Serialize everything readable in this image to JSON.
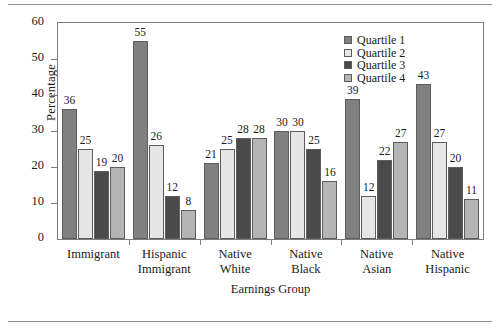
{
  "chart_data": {
    "type": "bar",
    "title": "",
    "xlabel": "Earnings Group",
    "ylabel": "Percentage",
    "ylim": [
      0,
      60
    ],
    "yticks": [
      0,
      10,
      20,
      30,
      40,
      50,
      60
    ],
    "grid": false,
    "legend_position": "top-right",
    "categories": [
      "Immigrant",
      "Hispanic Immigrant",
      "Native White",
      "Native Black",
      "Native Asian",
      "Native Hispanic"
    ],
    "category_lines": [
      [
        "Immigrant"
      ],
      [
        "Hispanic",
        "Immigrant"
      ],
      [
        "Native",
        "White"
      ],
      [
        "Native",
        "Black"
      ],
      [
        "Native",
        "Asian"
      ],
      [
        "Native",
        "Hispanic"
      ]
    ],
    "series": [
      {
        "name": "Quartile 1",
        "color": "#808080",
        "values": [
          36,
          55,
          21,
          30,
          39,
          43
        ]
      },
      {
        "name": "Quartile 2",
        "color": "#e6e6e6",
        "values": [
          25,
          26,
          25,
          30,
          12,
          27
        ]
      },
      {
        "name": "Quartile 3",
        "color": "#4a4a4a",
        "values": [
          19,
          12,
          28,
          25,
          22,
          20
        ]
      },
      {
        "name": "Quartile 4",
        "color": "#b5b5b5",
        "values": [
          20,
          8,
          28,
          16,
          27,
          11
        ]
      }
    ]
  }
}
